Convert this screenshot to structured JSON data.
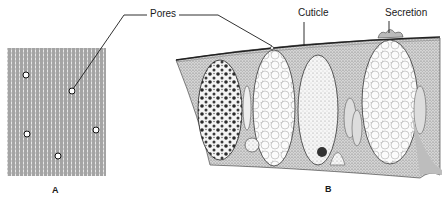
{
  "figure": {
    "panels": [
      {
        "id": "A",
        "label": "A",
        "description": "Surface view of cuticle with pores"
      },
      {
        "id": "B",
        "label": "B",
        "description": "Cross section of epithelium with cuticle and secretion"
      }
    ],
    "callouts": {
      "pores": "Pores",
      "cuticle": "Cuticle",
      "secretion": "Secretion"
    },
    "colors": {
      "ink": "#1a1a1a",
      "background": "#ffffff",
      "stipple": "#8a8a8a"
    }
  }
}
